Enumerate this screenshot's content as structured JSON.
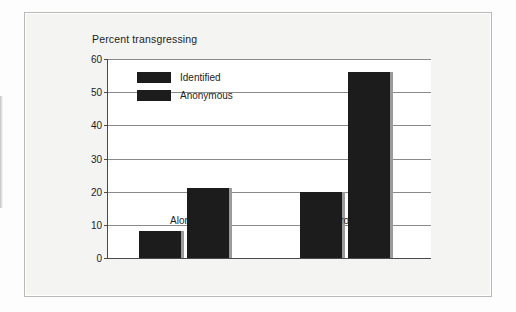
{
  "chart_data": {
    "type": "bar",
    "title": "Percent transgressing",
    "xlabel": "",
    "ylabel": "",
    "categories": [
      "Alone",
      "In groups"
    ],
    "series": [
      {
        "name": "Identified",
        "values": [
          8,
          20
        ],
        "color": "#1c1c1c"
      },
      {
        "name": "Anonymous",
        "values": [
          21,
          56
        ],
        "color": "#1c1c1c"
      }
    ],
    "ylim": [
      0,
      60
    ],
    "ytick_step": 10,
    "yticks": [
      0,
      10,
      20,
      30,
      40,
      50,
      60
    ],
    "ytick_labels": [
      "0",
      "10",
      "20",
      "30",
      "40",
      "50",
      "60"
    ],
    "grid": true,
    "legend_position": "top-left-inside"
  },
  "legend": {
    "entries": [
      {
        "label": "Identified"
      },
      {
        "label": "Anonymous"
      }
    ]
  },
  "axis": {
    "y_tick_labels": [
      "60",
      "50",
      "40",
      "30",
      "20",
      "10",
      "0"
    ],
    "x_tick_labels": [
      "Alone",
      "In groups"
    ]
  }
}
